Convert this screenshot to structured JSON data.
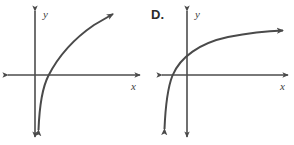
{
  "figure": {
    "background_color": "#ffffff",
    "line_color": "#4a4a4a",
    "axis_color": "#4d4d4d"
  },
  "panels": [
    {
      "id": "panel-left",
      "choice_label": "",
      "x_axis_label": "x",
      "y_axis_label": "y",
      "curve_description": "steep logarithmic curve with vertical asymptote just right of the y-axis, rising to upper right",
      "geometry": {
        "x_axis": {
          "x1": 8,
          "y1": 75,
          "x2": 140,
          "y2": 75
        },
        "y_axis": {
          "x1": 35,
          "y1": 11,
          "x2": 35,
          "y2": 137
        },
        "curve_path": "M 38.5 130 C 39.5 104, 42 88, 48.5 75.5 C 57 59, 72 40, 94 25 L 113 14",
        "curve_arrow_end": {
          "x": 115,
          "y": 12,
          "angle": -38
        },
        "curve_arrow_start": {
          "x": 38,
          "y": 136,
          "angle": 93
        },
        "x_label_pos": {
          "x": 131,
          "y": 90
        },
        "y_label_pos": {
          "x": 43,
          "y": 18
        },
        "choice_label_pos": {
          "x": 0,
          "y": 0
        }
      }
    },
    {
      "id": "panel-right",
      "choice_label": "D.",
      "x_axis_label": "x",
      "y_axis_label": "y",
      "curve_description": "gentle logarithmic curve with vertical asymptote left of the y-axis, rising slowly to the upper right",
      "geometry": {
        "x_axis": {
          "x1": 162,
          "y1": 75,
          "x2": 288,
          "y2": 75
        },
        "y_axis": {
          "x1": 187,
          "y1": 11,
          "x2": 187,
          "y2": 137
        },
        "curve_path": "M 164.5 129 C 165.5 105, 167.5 88, 172.5 75.5 C 180 57, 200 43, 228 37 C 252 32.5, 270 31, 283 30.5",
        "curve_arrow_end": {
          "x": 286,
          "y": 30,
          "angle": -4
        },
        "curve_arrow_start": {
          "x": 164,
          "y": 136,
          "angle": 93
        },
        "x_label_pos": {
          "x": 280,
          "y": 90
        },
        "y_label_pos": {
          "x": 195,
          "y": 18
        },
        "choice_label_pos": {
          "x": 151,
          "y": 19
        }
      }
    }
  ],
  "chart_data": {
    "type": "line",
    "title": "",
    "xlabel": "x",
    "ylabel": "y",
    "grid": false,
    "legend": null,
    "panels": [
      {
        "name": "left-graph",
        "label": "",
        "function": "logarithmic",
        "vertical_asymptote": "just right of the y-axis",
        "x_intercept": "slightly positive",
        "shape": "steeply increasing, concave down",
        "direction_arrows": [
          "down at lower end",
          "up-right at upper end"
        ]
      },
      {
        "name": "right-graph",
        "label": "D.",
        "function": "logarithmic",
        "vertical_asymptote": "just left of the y-axis",
        "x_intercept": "slightly negative",
        "shape": "gradually increasing, concave down",
        "direction_arrows": [
          "down at lower-left end",
          "right at upper-right end"
        ]
      }
    ]
  }
}
